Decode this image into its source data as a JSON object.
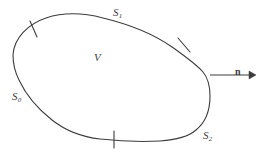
{
  "figure": {
    "type": "diagram",
    "background_color": "#ffffff",
    "stroke_color": "#3c3c3c",
    "text_color": "#3c3c3c",
    "labels": {
      "region": {
        "base": "V",
        "sub": ""
      },
      "surface_top": {
        "base": "S",
        "sub": "1"
      },
      "surface_left": {
        "base": "S",
        "sub": "0"
      },
      "surface_bottom_right": {
        "base": "S",
        "sub": "2"
      },
      "normal_vector": {
        "base": "n",
        "sub": ""
      }
    },
    "boundary": {
      "shape": "closed-blob",
      "tick_marks": 3,
      "tick_names": [
        "tick-upper-left",
        "tick-upper-right",
        "tick-bottom"
      ]
    },
    "arrow": {
      "name": "outward-normal-arrow",
      "direction": "right",
      "start_x": 210,
      "start_y": 75,
      "end_x": 253,
      "end_y": 75
    }
  }
}
